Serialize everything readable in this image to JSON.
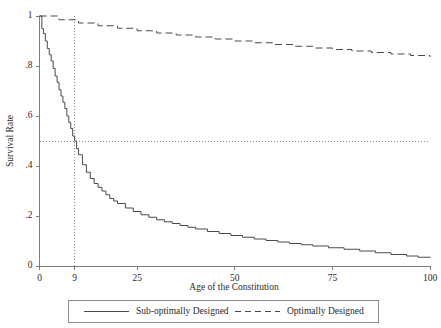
{
  "chart_data": {
    "type": "line",
    "title": "",
    "subtitle": "",
    "xlabel": "Age of the Constitution",
    "ylabel": "Survival Rate",
    "xlim": [
      0,
      100
    ],
    "ylim": [
      0,
      1
    ],
    "grid": false,
    "legend_position": "bottom",
    "x_ticks": [
      {
        "value": 0,
        "label": "0"
      },
      {
        "value": 9,
        "label": "9"
      },
      {
        "value": 25,
        "label": "25"
      },
      {
        "value": 50,
        "label": "50"
      },
      {
        "value": 75,
        "label": "75"
      },
      {
        "value": 100,
        "label": "100"
      }
    ],
    "y_ticks": [
      {
        "value": 0,
        "label": "0"
      },
      {
        "value": 0.2,
        "label": ".2"
      },
      {
        "value": 0.4,
        "label": ".4"
      },
      {
        "value": 0.6,
        "label": ".6"
      },
      {
        "value": 0.8,
        "label": ".8"
      },
      {
        "value": 1,
        "label": "1"
      }
    ],
    "annotations": [
      {
        "name": "median-vertical-reference",
        "type": "vline",
        "x": 9,
        "style": "dotted"
      },
      {
        "name": "median-horizontal-reference",
        "type": "hline",
        "y": 0.5,
        "style": "dotted"
      }
    ],
    "series": [
      {
        "name": "Sub-optimally Designed",
        "style": "solid",
        "shape": "step",
        "color": "#4a4a4a",
        "x": [
          0,
          0.6,
          1,
          1.5,
          2,
          2.5,
          3,
          3.5,
          4,
          4.5,
          5,
          5.5,
          6,
          6.5,
          7,
          7.5,
          8,
          8.5,
          9,
          9.5,
          10,
          11,
          12,
          13,
          14,
          15,
          16,
          17,
          18,
          19,
          20,
          22,
          24,
          26,
          28,
          30,
          32,
          34,
          36,
          38,
          40,
          43,
          46,
          49,
          52,
          55,
          58,
          61,
          64,
          67,
          70,
          74,
          78,
          82,
          86,
          90,
          94,
          97,
          100
        ],
        "y": [
          1,
          0.95,
          0.93,
          0.9,
          0.87,
          0.845,
          0.82,
          0.79,
          0.76,
          0.735,
          0.705,
          0.68,
          0.655,
          0.63,
          0.6,
          0.575,
          0.55,
          0.52,
          0.5,
          0.47,
          0.445,
          0.405,
          0.375,
          0.35,
          0.33,
          0.315,
          0.3,
          0.285,
          0.27,
          0.26,
          0.25,
          0.232,
          0.218,
          0.205,
          0.195,
          0.185,
          0.177,
          0.17,
          0.162,
          0.155,
          0.148,
          0.138,
          0.13,
          0.122,
          0.115,
          0.108,
          0.102,
          0.096,
          0.09,
          0.085,
          0.08,
          0.073,
          0.067,
          0.06,
          0.053,
          0.046,
          0.04,
          0.035,
          0.032
        ]
      },
      {
        "name": "Optimally Designed",
        "style": "dashed",
        "shape": "step",
        "color": "#4a4a4a",
        "x": [
          0,
          5,
          10,
          15,
          20,
          25,
          30,
          35,
          40,
          45,
          50,
          55,
          60,
          65,
          70,
          75,
          80,
          85,
          90,
          95,
          100
        ],
        "y": [
          1,
          0.985,
          0.972,
          0.961,
          0.951,
          0.941,
          0.932,
          0.924,
          0.916,
          0.908,
          0.9,
          0.893,
          0.886,
          0.879,
          0.872,
          0.866,
          0.86,
          0.854,
          0.848,
          0.842,
          0.836
        ]
      }
    ],
    "legend": [
      {
        "label": "Sub-optimally Designed",
        "style": "solid"
      },
      {
        "label": "Optimally Designed",
        "style": "dashed"
      }
    ]
  }
}
